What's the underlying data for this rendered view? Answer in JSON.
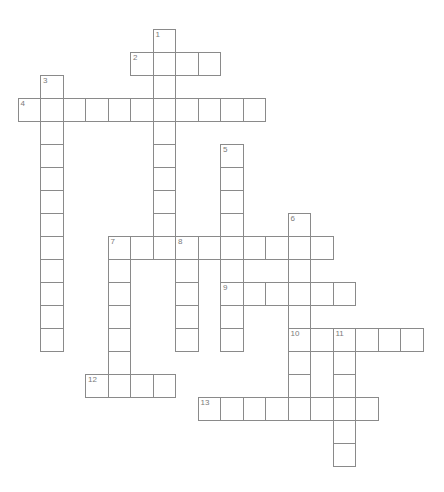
{
  "puzzle": {
    "grid": {
      "origin_x": 17.5,
      "origin_y": 29,
      "cell_w": 22.5,
      "cell_h": 23,
      "border_color": "#8a8a8a",
      "number_color": "#7a7a7a"
    },
    "entries": [
      {
        "number": "1",
        "direction": "down",
        "row": 0,
        "col": 6,
        "length": 10
      },
      {
        "number": "2",
        "direction": "across",
        "row": 1,
        "col": 5,
        "length": 4
      },
      {
        "number": "3",
        "direction": "down",
        "row": 2,
        "col": 1,
        "length": 12
      },
      {
        "number": "4",
        "direction": "across",
        "row": 3,
        "col": 0,
        "length": 11
      },
      {
        "number": "5",
        "direction": "down",
        "row": 5,
        "col": 9,
        "length": 9
      },
      {
        "number": "6",
        "direction": "down",
        "row": 8,
        "col": 12,
        "length": 9
      },
      {
        "number": "7",
        "direction": "across",
        "row": 9,
        "col": 4,
        "length": 10
      },
      {
        "number": "7",
        "direction": "down",
        "row": 9,
        "col": 4,
        "length": 7
      },
      {
        "number": "8",
        "direction": "down",
        "row": 9,
        "col": 7,
        "length": 5
      },
      {
        "number": "9",
        "direction": "across",
        "row": 11,
        "col": 9,
        "length": 6
      },
      {
        "number": "10",
        "direction": "across",
        "row": 13,
        "col": 12,
        "length": 6
      },
      {
        "number": "11",
        "direction": "down",
        "row": 13,
        "col": 14,
        "length": 6
      },
      {
        "number": "12",
        "direction": "across",
        "row": 15,
        "col": 3,
        "length": 4
      },
      {
        "number": "13",
        "direction": "across",
        "row": 16,
        "col": 8,
        "length": 8
      }
    ]
  }
}
